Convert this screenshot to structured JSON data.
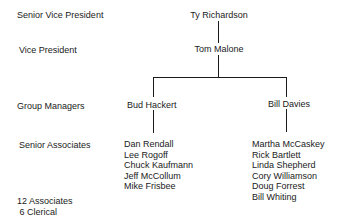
{
  "levels": {
    "senior_vp": "Senior Vice President",
    "vp": "Vice President",
    "group_managers": "Group Managers",
    "senior_associates": "Senior Associates"
  },
  "people": {
    "senior_vp": "Ty Richardson",
    "vp": "Tom Malone",
    "managers": [
      "Bud Hackert",
      "Bill Davies"
    ]
  },
  "teams": {
    "bud_hackert": [
      "Dan Rendall",
      "Lee Rogoff",
      "Chuck Kaufmann",
      "Jeff McCollum",
      "Mike Frisbee"
    ],
    "bill_davies": [
      "Martha McCaskey",
      "Rick Bartlett",
      "Linda Shepherd",
      "Cory Williamson",
      "Doug Forrest",
      "Bill Whiting"
    ]
  },
  "footer": {
    "associates": "12 Associates",
    "clerical": " 6 Clerical"
  }
}
